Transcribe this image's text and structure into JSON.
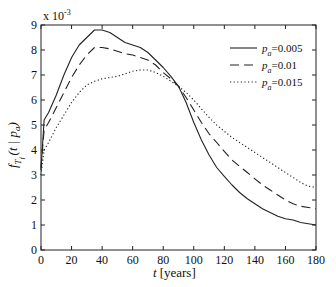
{
  "chart_data": {
    "type": "line",
    "title": "",
    "xlabel": "t [years]",
    "ylabel": "f_{T_f}(t | p_a)",
    "y_multiplier": "x 10^-3",
    "xlim": [
      0,
      180
    ],
    "ylim": [
      0,
      9
    ],
    "xticks": [
      0,
      20,
      40,
      60,
      80,
      100,
      120,
      140,
      160,
      180
    ],
    "yticks": [
      0,
      1,
      2,
      3,
      4,
      5,
      6,
      7,
      8,
      9
    ],
    "grid": false,
    "legend_position": "upper right",
    "x": [
      0,
      2,
      5,
      10,
      15,
      20,
      25,
      30,
      35,
      40,
      45,
      50,
      55,
      60,
      65,
      70,
      75,
      80,
      85,
      90,
      95,
      100,
      105,
      110,
      115,
      120,
      125,
      130,
      135,
      140,
      145,
      150,
      155,
      160,
      165,
      170,
      175,
      180
    ],
    "series": [
      {
        "name": "p_a=0.005",
        "style": "solid",
        "values": [
          3.2,
          5.2,
          5.5,
          6.2,
          7.0,
          7.7,
          8.2,
          8.5,
          8.8,
          8.8,
          8.7,
          8.5,
          8.3,
          8.2,
          8.1,
          7.9,
          7.6,
          7.3,
          6.95,
          6.55,
          5.9,
          5.1,
          4.4,
          3.8,
          3.3,
          2.95,
          2.6,
          2.3,
          2.05,
          1.85,
          1.65,
          1.5,
          1.35,
          1.25,
          1.2,
          1.1,
          1.05,
          1.0
        ]
      },
      {
        "name": "p_a=0.01",
        "style": "dashed",
        "values": [
          3.3,
          4.8,
          5.1,
          5.7,
          6.3,
          6.9,
          7.4,
          7.8,
          8.1,
          8.1,
          8.05,
          7.95,
          7.85,
          7.8,
          7.7,
          7.6,
          7.4,
          7.1,
          6.85,
          6.55,
          6.1,
          5.6,
          5.1,
          4.65,
          4.3,
          3.95,
          3.6,
          3.35,
          3.1,
          2.85,
          2.6,
          2.4,
          2.2,
          2.0,
          1.85,
          1.75,
          1.7,
          1.65
        ]
      },
      {
        "name": "p_a=0.015",
        "style": "dotted",
        "values": [
          3.0,
          4.0,
          4.3,
          4.9,
          5.4,
          5.9,
          6.3,
          6.6,
          6.75,
          6.85,
          6.9,
          6.95,
          7.05,
          7.15,
          7.2,
          7.2,
          7.1,
          6.95,
          6.75,
          6.55,
          6.3,
          6.0,
          5.65,
          5.3,
          5.0,
          4.75,
          4.5,
          4.3,
          4.1,
          3.9,
          3.7,
          3.5,
          3.3,
          3.1,
          2.9,
          2.7,
          2.55,
          2.5
        ]
      }
    ]
  },
  "axes": {
    "xlabel_italic": "t",
    "xlabel_unit": "[years]",
    "multiplier_base": "x 10",
    "multiplier_exp": "-3"
  },
  "legend": {
    "items": [
      {
        "symbol": "p",
        "sub": "a",
        "value": "=0.005",
        "style": "solid"
      },
      {
        "symbol": "p",
        "sub": "a",
        "value": "=0.01",
        "style": "dashed"
      },
      {
        "symbol": "p",
        "sub": "a",
        "value": "=0.015",
        "style": "dotted"
      }
    ]
  }
}
